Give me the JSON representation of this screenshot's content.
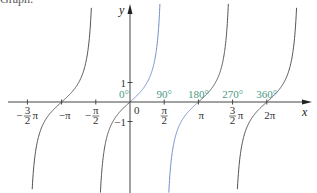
{
  "header": {
    "clipped_text": "Graph:"
  },
  "chart_data": {
    "type": "line",
    "title": "",
    "function": "y = tan x",
    "xlabel": "x",
    "ylabel": "y",
    "xlim": [
      -4.9,
      6.9
    ],
    "ylim": [
      -4.5,
      5.0
    ],
    "x_ticks": [
      {
        "value": -4.712389,
        "label_num": "3",
        "label_den": "2",
        "label": "-3/2 π",
        "sign": "−",
        "suffix": "π",
        "kind": "frac"
      },
      {
        "value": -3.141593,
        "label": "−π",
        "kind": "plain"
      },
      {
        "value": -1.570796,
        "label_num": "π",
        "label_den": "2",
        "sign": "−",
        "suffix": "",
        "kind": "frac"
      },
      {
        "value": 1.570796,
        "label_num": "π",
        "label_den": "2",
        "sign": "",
        "suffix": "",
        "kind": "frac"
      },
      {
        "value": 3.141593,
        "label": "π",
        "kind": "plain"
      },
      {
        "value": 4.712389,
        "label_num": "3",
        "label_den": "2",
        "sign": "",
        "suffix": "π",
        "kind": "frac"
      },
      {
        "value": 6.283185,
        "label": "2π",
        "kind": "plain"
      }
    ],
    "origin_label": "0",
    "y_ticks": [
      {
        "value": 1,
        "label": "1"
      },
      {
        "value": -1,
        "label": "−1"
      }
    ],
    "degree_labels": [
      {
        "value": 0,
        "label": "0°"
      },
      {
        "value": 1.570796,
        "label": "90°"
      },
      {
        "value": 3.141593,
        "label": "180°"
      },
      {
        "value": 4.712389,
        "label": "270°"
      },
      {
        "value": 6.283185,
        "label": "360°"
      }
    ],
    "series": [
      {
        "name": "tan branch (-3π/2, -π/2)",
        "center": -3.141593,
        "color": "#555555",
        "highlight": false
      },
      {
        "name": "tan branch (-π/2, π/2) left half",
        "center": 0,
        "from": -1.570796,
        "to": 0,
        "color": "#555555",
        "highlight": false
      },
      {
        "name": "tan branch (0, π/2)",
        "center": 0,
        "from": 0,
        "to": 1.570796,
        "color": "#6f8fc9",
        "highlight": true
      },
      {
        "name": "tan branch (π/2, π)",
        "center": 3.141593,
        "from": 1.570796,
        "to": 3.141593,
        "color": "#6f8fc9",
        "highlight": true
      },
      {
        "name": "tan branch (π, 3π/2)",
        "center": 3.141593,
        "from": 3.141593,
        "to": 4.712389,
        "color": "#555555",
        "highlight": false
      },
      {
        "name": "tan branch (3π/2, 5π/2)",
        "center": 6.283185,
        "color": "#555555",
        "highlight": false
      }
    ],
    "colors": {
      "axis": "#444444",
      "degree_label": "#4a9a86",
      "highlight_curve": "#6f8fc9",
      "curve": "#555555"
    },
    "grid": false,
    "legend": "none"
  }
}
